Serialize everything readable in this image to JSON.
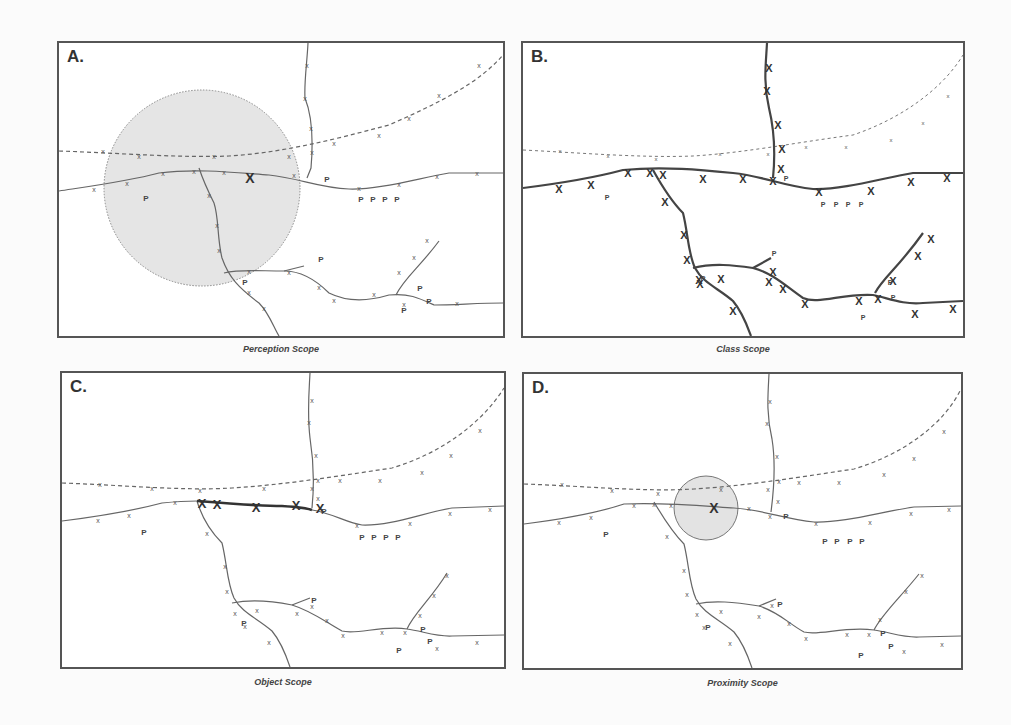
{
  "figure": {
    "panels": [
      {
        "id": "A",
        "label": "A.",
        "caption": "Perception Scope",
        "highlight": "large-perception-circle"
      },
      {
        "id": "B",
        "label": "B.",
        "caption": "Class Scope",
        "highlight": "all-solid-roads-bold"
      },
      {
        "id": "C",
        "label": "C.",
        "caption": "Object Scope",
        "highlight": "single-road-segment-bold"
      },
      {
        "id": "D",
        "label": "D.",
        "caption": "Proximity Scope",
        "highlight": "small-proximity-circle"
      }
    ],
    "legend_symbols": {
      "road_marker": "x",
      "poi_marker": "P",
      "focus_marker": "X"
    },
    "colors": {
      "border": "#555555",
      "line": "#666666",
      "circle_fill": "#e3e3e3",
      "text": "#333333"
    }
  }
}
